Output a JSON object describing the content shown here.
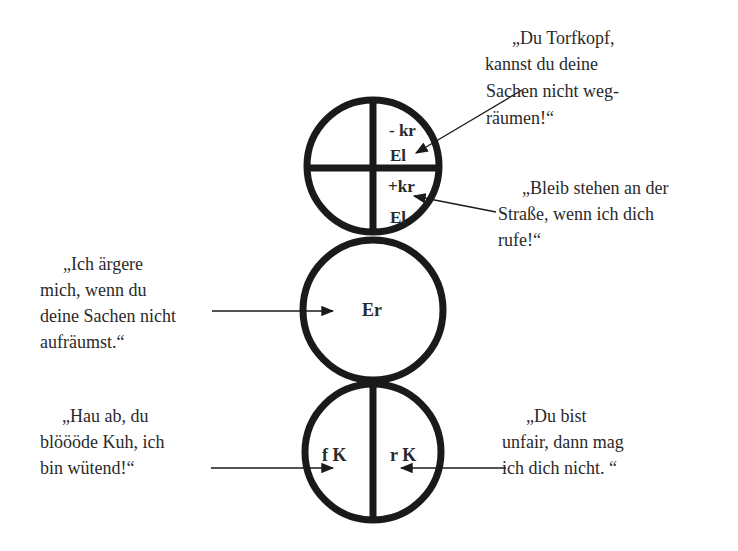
{
  "diagram": {
    "circles": {
      "top": {
        "labels": [
          "- kr",
          "El",
          "+kr",
          "El"
        ]
      },
      "middle": {
        "label": "Er"
      },
      "bottom": {
        "labels": [
          "f K",
          "r K"
        ]
      }
    },
    "quotes": {
      "top_right_1": {
        "lines": [
          "„Du Torfkopf,",
          "kannst du deine",
          "Sachen nicht weg-",
          "räumen!“"
        ]
      },
      "top_right_2": {
        "lines": [
          "„Bleib stehen an der",
          "Straße, wenn ich dich",
          "rufe!“"
        ]
      },
      "middle_left": {
        "lines": [
          "„Ich ärgere",
          "mich, wenn du",
          "deine Sachen nicht",
          "aufräumst.“"
        ]
      },
      "bottom_left": {
        "lines": [
          "„Hau ab, du",
          "blöööde Kuh, ich",
          "bin wütend!“"
        ]
      },
      "bottom_right": {
        "lines": [
          "„Du bist",
          "unfair, dann mag",
          "ich dich nicht. “"
        ]
      }
    },
    "colors": {
      "stroke": "#1a1a1a",
      "text": "#2a2a2a"
    }
  }
}
